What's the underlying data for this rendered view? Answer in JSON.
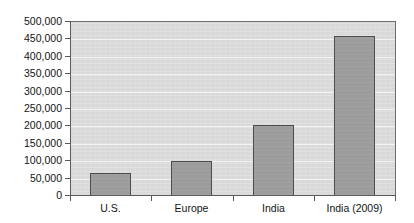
{
  "chart_data": {
    "type": "bar",
    "title": "",
    "subtitle": "",
    "xlabel": "",
    "ylabel": "",
    "categories": [
      "U.S.",
      "Europe",
      "India",
      "India (2009)"
    ],
    "values": [
      65000,
      102000,
      205000,
      460000
    ],
    "ylim": [
      0,
      500000
    ],
    "ytick_values": [
      0,
      50000,
      100000,
      150000,
      200000,
      250000,
      300000,
      350000,
      400000,
      450000,
      500000
    ],
    "ytick_labels": [
      "0",
      "50,000",
      "100,000",
      "150,000",
      "200,000",
      "250,000",
      "300,000",
      "350,000",
      "400,000",
      "450,000",
      "500,000"
    ],
    "grid": true,
    "grid_axis": "y",
    "legend": false,
    "legend_position": "none",
    "series": [
      {
        "name": "",
        "values": [
          65000,
          102000,
          205000,
          460000
        ]
      }
    ],
    "colors": {
      "bar_fill": "#9c9c9c",
      "bar_border": "#4d4d4d",
      "plot_background": "#d9d9d9",
      "gridline": "#f4f4f4",
      "axis": "#5a5a5a",
      "text": "#141414",
      "page_background": "#ffffff"
    }
  }
}
